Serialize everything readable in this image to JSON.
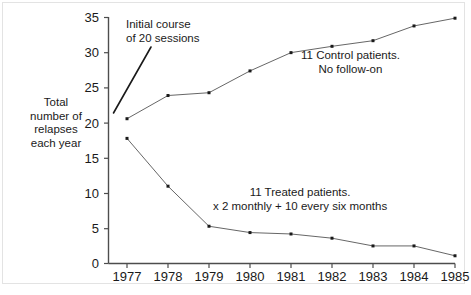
{
  "chart_data": {
    "type": "line",
    "title": "",
    "xlabel": "",
    "ylabel": "Total number of relapses each year",
    "x": [
      1977,
      1978,
      1979,
      1980,
      1981,
      1982,
      1983,
      1984,
      1985
    ],
    "xtick_labels": [
      "1977",
      "1978",
      "1979",
      "1980",
      "1981",
      "1982",
      "1983",
      "1984",
      "1985"
    ],
    "ytick_labels": [
      "0",
      "5",
      "10",
      "15",
      "20",
      "25",
      "30",
      "35"
    ],
    "yticks": [
      0,
      5,
      10,
      15,
      20,
      25,
      30,
      35
    ],
    "ylim": [
      0,
      35
    ],
    "xlim": [
      1976.6,
      1985.6
    ],
    "grid": false,
    "legend_position": "none",
    "series": [
      {
        "name": "11 Control patients. No follow-on",
        "values": [
          20.6,
          23.9,
          24.3,
          27.4,
          30.0,
          30.9,
          31.7,
          33.8,
          34.9
        ],
        "color": "#555555"
      },
      {
        "name": "11 Treated patients. x 2 monthly + 10 every six months",
        "values": [
          17.8,
          11.0,
          5.3,
          4.4,
          4.2,
          3.6,
          2.5,
          2.5,
          1.1
        ],
        "color": "#555555"
      }
    ],
    "annotations": [
      {
        "id": "initial-course",
        "line1": "Initial course",
        "line2": "of 20 sessions",
        "points_to_x": 1977,
        "points_to_y": 21.5
      },
      {
        "id": "control-patients",
        "line1": "11 Control patients.",
        "line2": "No follow-on"
      },
      {
        "id": "treated-patients",
        "line1": "11 Treated patients.",
        "line2": "x 2 monthly + 10 every six months"
      }
    ]
  },
  "ylabel_lines": {
    "l1": "Total",
    "l2": "number of",
    "l3": "relapses",
    "l4": "each year"
  },
  "annotations": {
    "initial": {
      "l1": "Initial course",
      "l2": "of 20 sessions"
    },
    "control": {
      "l1": "11 Control patients.",
      "l2": "No follow-on"
    },
    "treated": {
      "l1": "11 Treated patients.",
      "l2": "x 2 monthly + 10 every six months"
    }
  },
  "axis": {
    "y_ticks": [
      "35",
      "30",
      "25",
      "20",
      "15",
      "10",
      "5",
      "0"
    ],
    "x_ticks": [
      "1977",
      "1978",
      "1979",
      "1980",
      "1981",
      "1982",
      "1983",
      "1984",
      "1985"
    ]
  },
  "colors": {
    "line": "#555555",
    "marker": "#1a1a1a",
    "axis": "#4d4d4d",
    "text": "#1a1a1a",
    "frame": "#e3e3e3",
    "background": "#ffffff"
  }
}
